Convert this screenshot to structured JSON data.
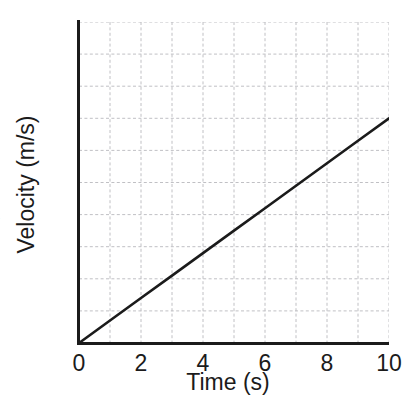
{
  "chart_data": {
    "type": "line",
    "title": "",
    "xlabel": "Time (s)",
    "ylabel": "Velocity (m/s)",
    "xlim": [
      0,
      10
    ],
    "ylim": [
      0,
      10
    ],
    "xticks": [
      0,
      2,
      4,
      6,
      8,
      10
    ],
    "yticks": [
      0,
      2,
      4,
      6,
      8,
      10
    ],
    "xtick_labels": [
      "0",
      "2",
      "4",
      "6",
      "8",
      "10"
    ],
    "ytick_labels": [
      "0",
      "2",
      "4",
      "6",
      "8",
      "10"
    ],
    "grid": true,
    "grid_spacing": 1,
    "grid_style": "dashed",
    "legend": null,
    "series": [
      {
        "name": "velocity",
        "x": [
          0,
          1,
          2,
          3,
          4,
          5,
          6,
          7,
          8,
          9,
          10
        ],
        "y": [
          0,
          0.7,
          1.4,
          2.1,
          2.8,
          3.5,
          4.2,
          4.9,
          5.6,
          6.3,
          7.0
        ],
        "slope": 0.7,
        "intercept": 0,
        "color": "#1b1b1b",
        "line_width": 2.6,
        "style": "solid"
      }
    ]
  },
  "colors": {
    "background": "#ffffff",
    "axis": "#1b1b1b",
    "grid": "#b9b9bd",
    "line": "#1b1b1b",
    "text": "#1b1b1b"
  },
  "axes": {
    "x_title": "Time (s)",
    "y_title": "Velocity (m/s)"
  },
  "ticks": {
    "y": [
      {
        "label": "10",
        "value": 10
      },
      {
        "label": "8",
        "value": 8
      },
      {
        "label": "6",
        "value": 6
      },
      {
        "label": "4",
        "value": 4
      },
      {
        "label": "2",
        "value": 2
      },
      {
        "label": "0",
        "value": 0
      }
    ],
    "x": [
      {
        "label": "0",
        "value": 0
      },
      {
        "label": "2",
        "value": 2
      },
      {
        "label": "4",
        "value": 4
      },
      {
        "label": "6",
        "value": 6
      },
      {
        "label": "8",
        "value": 8
      },
      {
        "label": "10",
        "value": 10
      }
    ]
  }
}
